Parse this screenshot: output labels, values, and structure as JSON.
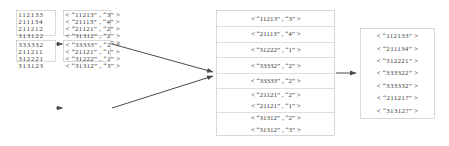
{
  "diagram": {
    "stroke_color": "#8a8a8a",
    "text_color": "#3a3a3a",
    "background": "#ffffff",
    "stages": [
      {
        "name": "input-splits",
        "boxes": [
          {
            "id": "input-split-1",
            "rows": [
              "112133",
              "211134",
              "211212",
              "313122",
              "333322"
            ]
          },
          {
            "id": "input-split-2",
            "rows": [
              "333332",
              "211211",
              "312221",
              "313123"
            ]
          }
        ]
      },
      {
        "name": "map-outputs",
        "boxes": [
          {
            "id": "map-output-1",
            "rows": [
              "< “11213” , “3” >",
              "< “21113” , “4” >",
              "< “21121” , “2” >",
              "< “31312” , “2” >",
              "< “33332” , “2” >"
            ]
          },
          {
            "id": "map-output-2",
            "rows": [
              "< “33333” , “2” >",
              "< “21121” , “1” >",
              "< “31222” , “1” >",
              "< “31312” , “3” >"
            ]
          }
        ]
      },
      {
        "name": "reduce-input",
        "boxes": [
          {
            "id": "reduce-input",
            "groups": [
              {
                "rows": [
                  "< “11213” , “3” >"
                ]
              },
              {
                "rows": [
                  "< “21113” , “4” >"
                ]
              },
              {
                "rows": [
                  "< “31222” , “1” >"
                ]
              },
              {
                "rows": [
                  "< “33332” , “2” >"
                ]
              },
              {
                "rows": [
                  "< “33333” , “2” >"
                ]
              },
              {
                "rows": [
                  "< “21121” , “2” >",
                  "< “21121” , “1” >"
                ]
              },
              {
                "rows": [
                  "< “31312” , “2” >",
                  "< “31312” , “3” >"
                ]
              }
            ]
          }
        ]
      },
      {
        "name": "final-output",
        "boxes": [
          {
            "id": "final-output",
            "rows": [
              "< “112133” >",
              "< “211134” >",
              "< “312221” >",
              "< “333322” >",
              "< “333332” >",
              "< “21121?” >",
              "< “31312?” >"
            ]
          }
        ]
      }
    ],
    "arrows": [
      {
        "name": "arrow-split1-to-map1",
        "from": "input-split-1",
        "to": "map-output-1"
      },
      {
        "name": "arrow-split2-to-map2",
        "from": "input-split-2",
        "to": "map-output-2"
      },
      {
        "name": "arrow-map1-to-reduce",
        "from": "map-output-1",
        "to": "reduce-input"
      },
      {
        "name": "arrow-map2-to-reduce",
        "from": "map-output-2",
        "to": "reduce-input"
      },
      {
        "name": "arrow-reduce-to-output",
        "from": "reduce-input",
        "to": "final-output"
      }
    ]
  }
}
